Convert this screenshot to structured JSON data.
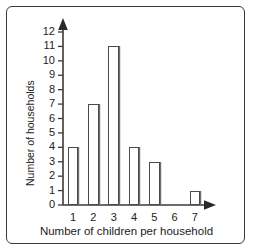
{
  "chart_data": {
    "type": "bar",
    "title": "",
    "xlabel": "Number of children per household",
    "ylabel": "Number of households",
    "categories": [
      "1",
      "2",
      "3",
      "4",
      "5",
      "6",
      "7"
    ],
    "values": [
      4,
      7,
      11,
      4,
      3,
      0,
      1
    ],
    "ylim": [
      0,
      12
    ],
    "yticks": [
      "0",
      "1",
      "2",
      "3",
      "4",
      "5",
      "6",
      "7",
      "8",
      "9",
      "10",
      "11",
      "12"
    ],
    "grid": false,
    "legend": null,
    "bar_fill_color": "#ffffff",
    "bar_edge_color": "#4a4a4a",
    "axis_color": "#3a3a3a",
    "border_color": "#3a3a3a",
    "background_color": "#ffffff"
  }
}
